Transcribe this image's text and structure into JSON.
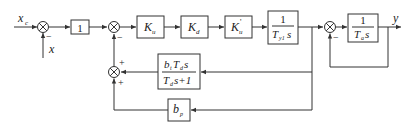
{
  "diagram": {
    "type": "control block diagram",
    "input_label": "x",
    "input_sub": "c",
    "feedback_input_label": "x",
    "output_label": "y",
    "blocks": [
      {
        "id": "unity",
        "label": "1"
      },
      {
        "id": "ku",
        "label": "K",
        "sub": "u"
      },
      {
        "id": "kd",
        "label": "K",
        "sub": "d"
      },
      {
        "id": "kup",
        "label": "K",
        "sup": "'",
        "sub": "u"
      },
      {
        "id": "ty",
        "num": "1",
        "den": "T",
        "den_sub": "y1",
        "den_s": "s"
      },
      {
        "id": "ta",
        "num": "1",
        "den": "T",
        "den_sub": "a",
        "den_s": "s"
      },
      {
        "id": "bt",
        "num_pre": "b",
        "num_pre_sub": "t",
        "num_T": "T",
        "num_T_sub": "d",
        "num_s": "s",
        "den_T": "T",
        "den_T_sub": "d",
        "den_rest": "s+1"
      },
      {
        "id": "bp",
        "label": "b",
        "sub": "p"
      }
    ],
    "signs": {
      "sum1_bottom": "−",
      "sum2_bottom": "−",
      "sum3_bottom": "−",
      "sum4_top": "+",
      "sum4_bottom": "+"
    }
  }
}
